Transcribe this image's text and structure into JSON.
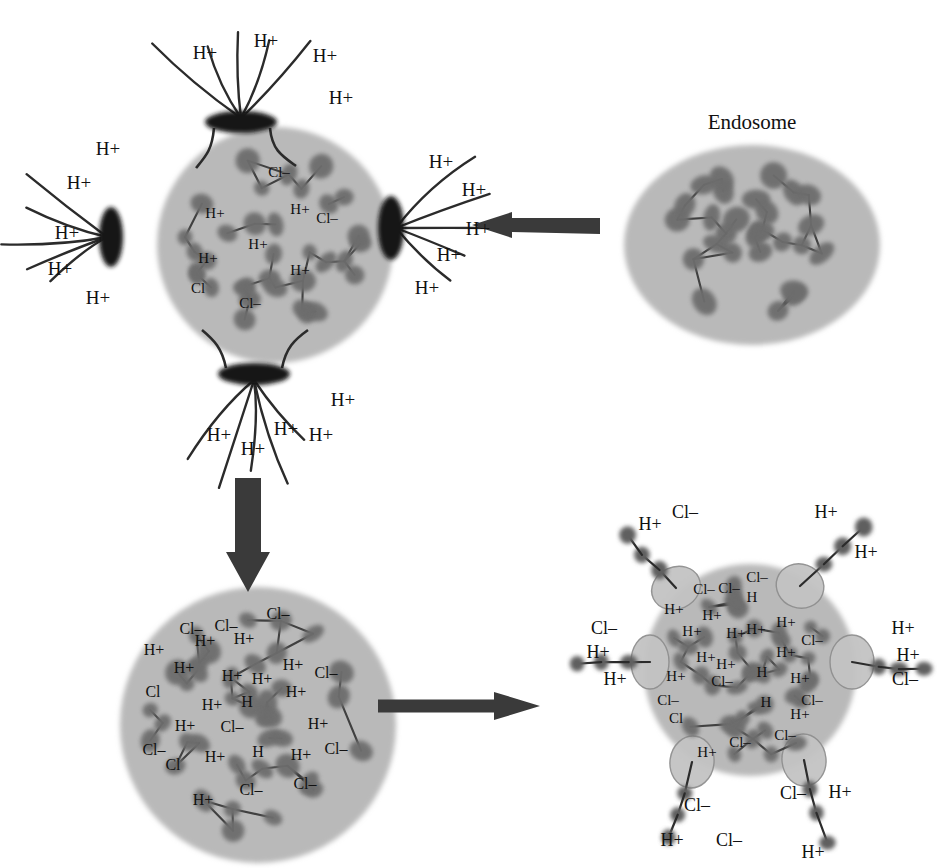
{
  "figure": {
    "type": "diagram",
    "labels": {
      "endosome": "Endosome"
    },
    "ion_text": {
      "proton": "H+",
      "chloride": "Cl–"
    },
    "colors": {
      "background": "#ffffff",
      "vesicle_fill": "#b9b9b9",
      "vesicle_fill_light": "#c3c3c3",
      "bead": "#6d6d6d",
      "bead_dark": "#5f5f5f",
      "channel": "#151515",
      "arrow": "#3a3a3a",
      "line": "#2b2b2b",
      "text": "#111111"
    }
  },
  "panels": [
    {
      "id": "panel-top-left",
      "name": "polyplex-with-proton-channels",
      "center": [
        275,
        245
      ],
      "radius": 118,
      "channels": [
        {
          "name": "channel-top",
          "cx": 241,
          "cy": 122,
          "rx": 36,
          "ry": 11,
          "rot": 0
        },
        {
          "name": "channel-bottom",
          "cx": 254,
          "cy": 374,
          "rx": 36,
          "ry": 11,
          "rot": 0
        },
        {
          "name": "channel-left",
          "cx": 111,
          "cy": 237,
          "rx": 12,
          "ry": 30,
          "rot": 0
        },
        {
          "name": "channel-right",
          "cx": 391,
          "cy": 228,
          "rx": 13,
          "ry": 32,
          "rot": 0
        }
      ],
      "proton_labels": [
        {
          "text": "H+",
          "x": 205,
          "y": 52
        },
        {
          "text": "H+",
          "x": 266,
          "y": 40
        },
        {
          "text": "H+",
          "x": 325,
          "y": 55
        },
        {
          "text": "H+",
          "x": 341,
          "y": 97
        },
        {
          "text": "H+",
          "x": 108,
          "y": 148
        },
        {
          "text": "H+",
          "x": 79,
          "y": 182
        },
        {
          "text": "H+",
          "x": 67,
          "y": 232
        },
        {
          "text": "H+",
          "x": 60,
          "y": 268
        },
        {
          "text": "H+",
          "x": 98,
          "y": 297
        },
        {
          "text": "H+",
          "x": 441,
          "y": 161
        },
        {
          "text": "H+",
          "x": 474,
          "y": 189
        },
        {
          "text": "H+",
          "x": 478,
          "y": 228
        },
        {
          "text": "H+",
          "x": 449,
          "y": 254
        },
        {
          "text": "H+",
          "x": 427,
          "y": 287
        },
        {
          "text": "H+",
          "x": 219,
          "y": 434
        },
        {
          "text": "H+",
          "x": 253,
          "y": 448
        },
        {
          "text": "H+",
          "x": 286,
          "y": 428
        },
        {
          "text": "H+",
          "x": 321,
          "y": 434
        },
        {
          "text": "H+",
          "x": 343,
          "y": 399
        }
      ],
      "inner_labels": [
        {
          "text": "Cl–",
          "x": 279,
          "y": 172
        },
        {
          "text": "Cl–",
          "x": 327,
          "y": 218
        },
        {
          "text": "H+",
          "x": 215,
          "y": 213
        },
        {
          "text": "H+",
          "x": 300,
          "y": 209
        },
        {
          "text": "H+",
          "x": 258,
          "y": 244
        },
        {
          "text": "H+",
          "x": 208,
          "y": 258
        },
        {
          "text": "H+",
          "x": 300,
          "y": 270
        },
        {
          "text": "Cl–",
          "x": 250,
          "y": 303
        },
        {
          "text": "Cl",
          "x": 198,
          "y": 288
        }
      ]
    },
    {
      "id": "panel-top-right",
      "name": "endosome",
      "center": [
        752,
        245
      ],
      "rx": 128,
      "ry": 100,
      "title": {
        "text": "Endosome",
        "x": 752,
        "y": 122
      }
    },
    {
      "id": "panel-bottom-left",
      "name": "swollen-polyplex",
      "center": [
        258,
        725
      ],
      "radius": 138,
      "inner_labels": [
        {
          "text": "Cl–",
          "x": 191,
          "y": 629
        },
        {
          "text": "Cl–",
          "x": 226,
          "y": 626
        },
        {
          "text": "Cl–",
          "x": 278,
          "y": 614
        },
        {
          "text": "H+",
          "x": 154,
          "y": 650
        },
        {
          "text": "H+",
          "x": 205,
          "y": 641
        },
        {
          "text": "H+",
          "x": 244,
          "y": 639
        },
        {
          "text": "H+",
          "x": 184,
          "y": 668
        },
        {
          "text": "H+",
          "x": 232,
          "y": 676
        },
        {
          "text": "H+",
          "x": 262,
          "y": 679
        },
        {
          "text": "H+",
          "x": 293,
          "y": 665
        },
        {
          "text": "Cl–",
          "x": 326,
          "y": 673
        },
        {
          "text": "H+",
          "x": 296,
          "y": 692
        },
        {
          "text": "Cl",
          "x": 153,
          "y": 692
        },
        {
          "text": "H+",
          "x": 212,
          "y": 705
        },
        {
          "text": "H",
          "x": 247,
          "y": 702
        },
        {
          "text": "H+",
          "x": 185,
          "y": 726
        },
        {
          "text": "Cl–",
          "x": 232,
          "y": 727
        },
        {
          "text": "H+",
          "x": 318,
          "y": 724
        },
        {
          "text": "Cl–",
          "x": 154,
          "y": 750
        },
        {
          "text": "H+",
          "x": 215,
          "y": 757
        },
        {
          "text": "H",
          "x": 258,
          "y": 752
        },
        {
          "text": "H+",
          "x": 301,
          "y": 755
        },
        {
          "text": "Cl–",
          "x": 336,
          "y": 749
        },
        {
          "text": "Cl",
          "x": 173,
          "y": 765
        },
        {
          "text": "Cl–",
          "x": 251,
          "y": 790
        },
        {
          "text": "Cl–",
          "x": 305,
          "y": 784
        },
        {
          "text": "H+",
          "x": 203,
          "y": 800
        }
      ]
    },
    {
      "id": "panel-bottom-right",
      "name": "ruptured-polyplex",
      "center": [
        750,
        670
      ],
      "radius": 106,
      "vesicles": [
        {
          "name": "vesicle-top-left",
          "cx": 676,
          "cy": 588,
          "rx": 25,
          "ry": 21,
          "rot": -25
        },
        {
          "name": "vesicle-top-right",
          "cx": 800,
          "cy": 586,
          "rx": 24,
          "ry": 22,
          "rot": 20
        },
        {
          "name": "vesicle-left",
          "cx": 650,
          "cy": 662,
          "rx": 19,
          "ry": 27,
          "rot": 0
        },
        {
          "name": "vesicle-right",
          "cx": 852,
          "cy": 662,
          "rx": 22,
          "ry": 27,
          "rot": 0
        },
        {
          "name": "vesicle-bottom-left",
          "cx": 692,
          "cy": 762,
          "rx": 22,
          "ry": 26,
          "rot": 8
        },
        {
          "name": "vesicle-bottom-right",
          "cx": 804,
          "cy": 760,
          "rx": 22,
          "ry": 26,
          "rot": -6
        }
      ],
      "outer_labels": [
        {
          "text": "Cl–",
          "x": 685,
          "y": 512
        },
        {
          "text": "H+",
          "x": 650,
          "y": 524
        },
        {
          "text": "H+",
          "x": 826,
          "y": 512
        },
        {
          "text": "H+",
          "x": 866,
          "y": 552
        },
        {
          "text": "Cl–",
          "x": 604,
          "y": 628
        },
        {
          "text": "H+",
          "x": 598,
          "y": 652
        },
        {
          "text": "H+",
          "x": 615,
          "y": 679
        },
        {
          "text": "H+",
          "x": 903,
          "y": 628
        },
        {
          "text": "H+",
          "x": 908,
          "y": 655
        },
        {
          "text": "Cl–",
          "x": 905,
          "y": 679
        },
        {
          "text": "Cl–",
          "x": 697,
          "y": 805
        },
        {
          "text": "H+",
          "x": 672,
          "y": 840
        },
        {
          "text": "Cl–",
          "x": 729,
          "y": 840
        },
        {
          "text": "Cl–",
          "x": 793,
          "y": 793
        },
        {
          "text": "H+",
          "x": 840,
          "y": 792
        },
        {
          "text": "H+",
          "x": 813,
          "y": 852
        }
      ],
      "inner_labels": [
        {
          "text": "Cl–",
          "x": 704,
          "y": 589
        },
        {
          "text": "Cl–",
          "x": 729,
          "y": 588
        },
        {
          "text": "Cl–",
          "x": 757,
          "y": 577
        },
        {
          "text": "H+",
          "x": 674,
          "y": 609
        },
        {
          "text": "H+",
          "x": 712,
          "y": 615
        },
        {
          "text": "H",
          "x": 752,
          "y": 597
        },
        {
          "text": "H+",
          "x": 692,
          "y": 631
        },
        {
          "text": "H+",
          "x": 736,
          "y": 633
        },
        {
          "text": "H+",
          "x": 756,
          "y": 629
        },
        {
          "text": "H+",
          "x": 786,
          "y": 622
        },
        {
          "text": "Cl–",
          "x": 812,
          "y": 640
        },
        {
          "text": "H+",
          "x": 786,
          "y": 652
        },
        {
          "text": "H+",
          "x": 706,
          "y": 657
        },
        {
          "text": "H+",
          "x": 726,
          "y": 664
        },
        {
          "text": "H+",
          "x": 676,
          "y": 676
        },
        {
          "text": "Cl–",
          "x": 722,
          "y": 681
        },
        {
          "text": "H",
          "x": 762,
          "y": 672
        },
        {
          "text": "H+",
          "x": 800,
          "y": 678
        },
        {
          "text": "Cl–",
          "x": 668,
          "y": 700
        },
        {
          "text": "H",
          "x": 766,
          "y": 702
        },
        {
          "text": "Cl–",
          "x": 812,
          "y": 700
        },
        {
          "text": "Cl",
          "x": 676,
          "y": 718
        },
        {
          "text": "H+",
          "x": 800,
          "y": 714
        },
        {
          "text": "Cl–",
          "x": 740,
          "y": 742
        },
        {
          "text": "Cl–",
          "x": 785,
          "y": 735
        },
        {
          "text": "H+",
          "x": 707,
          "y": 752
        }
      ]
    }
  ],
  "arrows": [
    {
      "name": "arrow-endosome-to-polyplex",
      "direction": "left",
      "x1": 600,
      "y1": 225,
      "x2": 472,
      "y2": 225
    },
    {
      "name": "arrow-polyplex-to-swollen",
      "direction": "down",
      "x1": 248,
      "y1": 478,
      "x2": 248,
      "y2": 592
    },
    {
      "name": "arrow-swollen-to-ruptured",
      "direction": "right",
      "x1": 378,
      "y1": 706,
      "x2": 540,
      "y2": 706
    }
  ]
}
